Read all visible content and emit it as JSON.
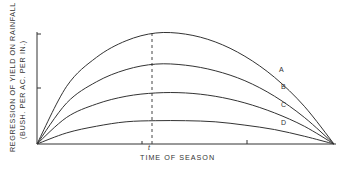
{
  "chart_data": {
    "type": "line",
    "title": "",
    "xlabel": "TIME OF SEASON",
    "ylabel": "REGRESSION OF YIELD ON RAINFALL",
    "ylabel_units": "(BUSH. PER AC. PER IN.)",
    "x_marker_label": "t",
    "x": [
      0,
      0.1,
      0.2,
      0.3,
      0.4,
      0.5,
      0.6,
      0.7,
      0.8,
      0.9,
      1.0
    ],
    "series": [
      {
        "name": "A",
        "values": [
          0,
          0.52,
          0.78,
          0.93,
          1.0,
          0.99,
          0.92,
          0.79,
          0.6,
          0.34,
          0
        ]
      },
      {
        "name": "B",
        "values": [
          0,
          0.37,
          0.56,
          0.67,
          0.72,
          0.71,
          0.66,
          0.57,
          0.43,
          0.24,
          0
        ]
      },
      {
        "name": "C",
        "values": [
          0,
          0.24,
          0.36,
          0.43,
          0.46,
          0.46,
          0.43,
          0.37,
          0.28,
          0.16,
          0
        ]
      },
      {
        "name": "D",
        "values": [
          0,
          0.1,
          0.16,
          0.2,
          0.21,
          0.21,
          0.2,
          0.17,
          0.13,
          0.07,
          0
        ]
      }
    ],
    "vertical_marker_x": 0.39,
    "ylim": [
      0,
      1
    ],
    "grid": false,
    "legend_position": "inline-right"
  }
}
